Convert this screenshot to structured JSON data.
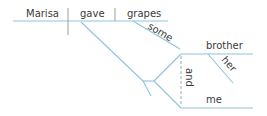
{
  "diagram": {
    "type": "sentence-diagram",
    "words": {
      "subject": "Marisa",
      "verb": "gave",
      "direct_object": "grapes",
      "object_modifier": "some",
      "indirect_object_1": "brother",
      "indirect_object_1_modifier": "her",
      "conjunction": "and",
      "indirect_object_2": "me"
    },
    "colors": {
      "line": "#8fc4dc",
      "divider": "#9aa0a4",
      "text": "#3a3a3a"
    }
  }
}
